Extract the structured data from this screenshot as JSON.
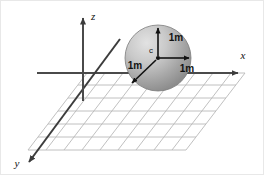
{
  "figure": {
    "background_color": "#ffffff",
    "border_color": "#e8e8e8",
    "width": 264,
    "height": 175
  },
  "axes": {
    "line_color": "#4a4a4a",
    "items": [
      {
        "id": "z",
        "label": "z",
        "direction": "up",
        "label_x": 88,
        "label_y": 16
      },
      {
        "id": "x",
        "label": "x",
        "direction": "right",
        "label_x": 243,
        "label_y": 58
      },
      {
        "id": "y",
        "label": "y",
        "direction": "down-left",
        "label_x": 16,
        "label_y": 166
      }
    ]
  },
  "grid": {
    "line_color": "#b9b9b9",
    "horizontal_rows": 7,
    "diagonal_columns": 10,
    "plane": "xy-ground-plane"
  },
  "sphere": {
    "center_label": "c",
    "center_x": 157,
    "center_y": 57,
    "radius": 33,
    "fill_light": "#d8d8d8",
    "fill_dark": "#8e8e8e",
    "edge_color": "#6f6f6f"
  },
  "dimensions": {
    "arrow_color": "#111111",
    "items": [
      {
        "id": "radius-up",
        "label": "1m",
        "direction": "up",
        "label_x": 175,
        "label_y": 37
      },
      {
        "id": "radius-right",
        "label": "1m",
        "direction": "right",
        "label_x": 185,
        "label_y": 69
      },
      {
        "id": "radius-down-left",
        "label": "1m",
        "direction": "down-left",
        "label_x": 133,
        "label_y": 66
      }
    ]
  }
}
